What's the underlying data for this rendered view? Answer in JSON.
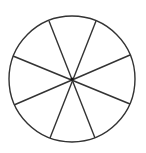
{
  "diagram": {
    "type": "circle-divided-into-sectors",
    "sector_count": 8,
    "stroke_color": "#333333",
    "fill_color": "#ffffff",
    "circle": {
      "cx": 72,
      "cy": 79,
      "r": 63
    },
    "spokes": [
      {
        "x1": 49,
        "y1": 21,
        "x2": 95,
        "y2": 138
      },
      {
        "x1": 96,
        "y1": 21,
        "x2": 50,
        "y2": 138
      },
      {
        "x1": 13,
        "y1": 56,
        "x2": 130,
        "y2": 104
      },
      {
        "x1": 130,
        "y1": 55,
        "x2": 14,
        "y2": 105
      }
    ]
  }
}
